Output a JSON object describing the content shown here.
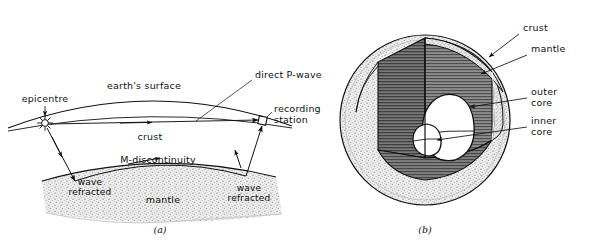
{
  "figure": {
    "title_semantic": "earthquake-wave-paths-and-earth-internal-structure",
    "panels": [
      {
        "id": "a",
        "caption": "(a)",
        "labels": [
          {
            "name": "epicentre",
            "text": "epicentre"
          },
          {
            "name": "earths-surface",
            "text": "earth's surface"
          },
          {
            "name": "direct-p-wave",
            "text": "direct P-wave"
          },
          {
            "name": "recording-station",
            "text": "recording\nstation",
            "line1": "recording",
            "line2": "station"
          },
          {
            "name": "crust",
            "text": "crust"
          },
          {
            "name": "m-discontinuity",
            "text": "M-discontinuity"
          },
          {
            "name": "wave-refracted-left",
            "line1": "wave",
            "line2": "refracted"
          },
          {
            "name": "wave-refracted-right",
            "line1": "wave",
            "line2": "refracted"
          },
          {
            "name": "mantle",
            "text": "mantle"
          }
        ]
      },
      {
        "id": "b",
        "caption": "(b)",
        "labels": [
          {
            "name": "crust",
            "text": "crust"
          },
          {
            "name": "mantle",
            "text": "mantle"
          },
          {
            "name": "outer-core",
            "line1": "outer",
            "line2": "core"
          },
          {
            "name": "inner-core",
            "line1": "inner",
            "line2": "core"
          }
        ]
      }
    ],
    "colors": {
      "ink": "#111111",
      "stipple_light": "#d2d2d2",
      "hatch_dark": "#6e6e6e",
      "hatch_mid": "#8a8a8a",
      "white": "#ffffff",
      "background": "#ffffff"
    },
    "markers": {
      "epicentre_symbol": "starburst",
      "recording_station_symbol": "small-square"
    }
  }
}
